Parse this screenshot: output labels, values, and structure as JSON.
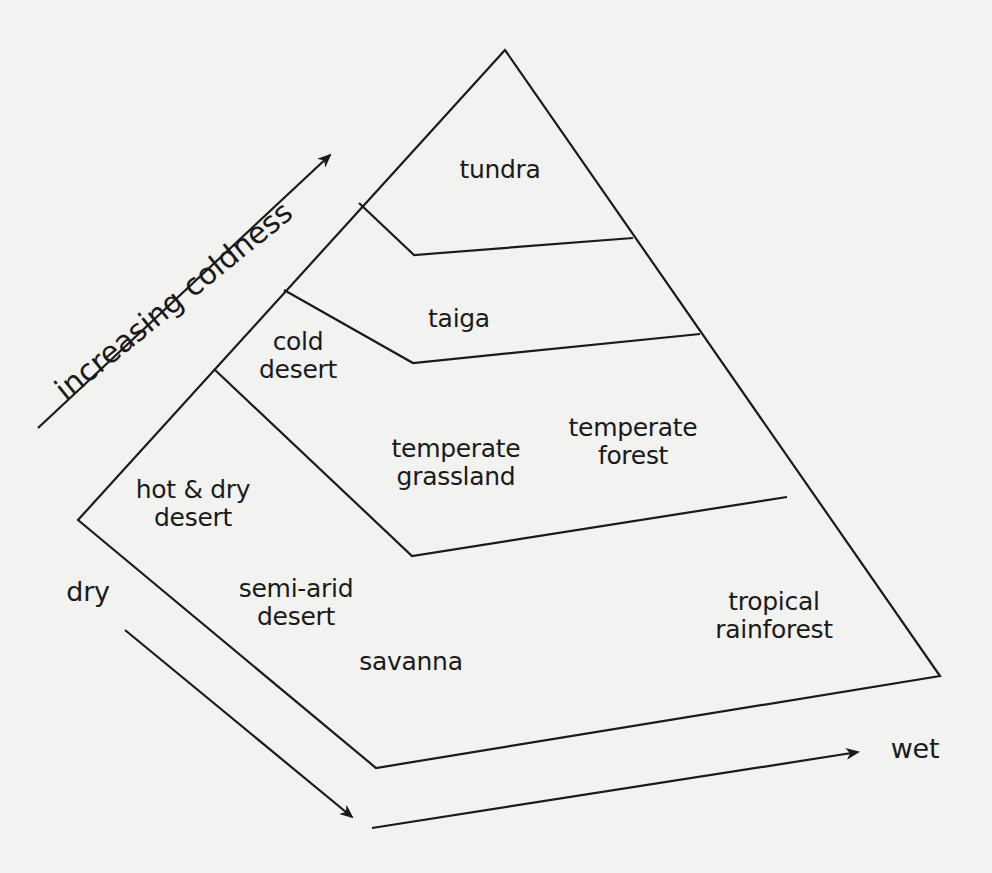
{
  "diagram": {
    "type": "biome pyramid",
    "axes": {
      "coldness_label": "increasing coldness",
      "dry_label": "dry",
      "wet_label": "wet"
    },
    "biomes": [
      {
        "name": "tundra",
        "label": "tundra",
        "tier": "top"
      },
      {
        "name": "cold-desert",
        "label": "cold\ndesert",
        "tier": "cold"
      },
      {
        "name": "taiga",
        "label": "taiga",
        "tier": "cold"
      },
      {
        "name": "hot-dry-desert",
        "label": "hot & dry\ndesert",
        "tier": "temperate"
      },
      {
        "name": "temperate-grassland",
        "label": "temperate\ngrassland",
        "tier": "temperate"
      },
      {
        "name": "temperate-forest",
        "label": "temperate\nforest",
        "tier": "temperate"
      },
      {
        "name": "semi-arid-desert",
        "label": "semi-arid\ndesert",
        "tier": "tropical"
      },
      {
        "name": "savanna",
        "label": "savanna",
        "tier": "tropical"
      },
      {
        "name": "tropical-rainforest",
        "label": "tropical\nrainforest",
        "tier": "tropical"
      }
    ]
  },
  "colors": {
    "background": "#f2f2f0",
    "ink": "#1a1a1a"
  }
}
